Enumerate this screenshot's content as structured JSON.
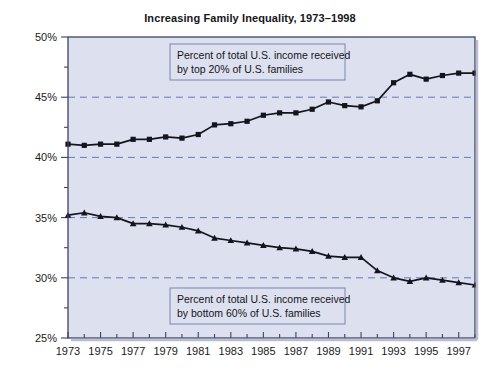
{
  "chart_data": {
    "type": "line",
    "title": "Increasing Family Inequality, 1973–1998",
    "xlabel": "",
    "ylabel": "",
    "xlim": [
      1973,
      1998
    ],
    "ylim": [
      25,
      50
    ],
    "yticks": [
      25,
      30,
      35,
      40,
      45,
      50
    ],
    "ytick_labels": [
      "25%",
      "30%",
      "35%",
      "40%",
      "45%",
      "50%"
    ],
    "y_minor_ticks": [
      27.5,
      32.5,
      37.5,
      42.5,
      47.5
    ],
    "gridlines": [
      30,
      35,
      40,
      45
    ],
    "grid": "horizontal-dashed",
    "legend": "none",
    "x": [
      1973,
      1974,
      1975,
      1976,
      1977,
      1978,
      1979,
      1980,
      1981,
      1982,
      1983,
      1984,
      1985,
      1986,
      1987,
      1988,
      1989,
      1990,
      1991,
      1992,
      1993,
      1994,
      1995,
      1996,
      1997,
      1998
    ],
    "xticks": [
      1973,
      1975,
      1977,
      1979,
      1981,
      1983,
      1985,
      1987,
      1989,
      1991,
      1993,
      1995,
      1997
    ],
    "xtick_labels": [
      "1973",
      "1975",
      "1977",
      "1979",
      "1981",
      "1983",
      "1985",
      "1987",
      "1989",
      "1991",
      "1993",
      "1995",
      "1997"
    ],
    "series": [
      {
        "name": "Percent of total U.S. income received by top 20% of U.S. families",
        "marker": "square",
        "color": "#14141c",
        "values": [
          41.1,
          41.0,
          41.1,
          41.1,
          41.5,
          41.5,
          41.7,
          41.6,
          41.9,
          42.7,
          42.8,
          43.0,
          43.5,
          43.7,
          43.7,
          44.0,
          44.6,
          44.3,
          44.2,
          44.7,
          46.2,
          46.9,
          46.5,
          46.8,
          47.0,
          47.0
        ]
      },
      {
        "name": "Percent of total U.S. income received by bottom 60% of U.S. families",
        "marker": "triangle",
        "color": "#14141c",
        "values": [
          35.2,
          35.4,
          35.1,
          35.0,
          34.5,
          34.5,
          34.4,
          34.2,
          33.9,
          33.3,
          33.1,
          32.9,
          32.7,
          32.5,
          32.4,
          32.2,
          31.8,
          31.7,
          31.7,
          30.6,
          30.0,
          29.7,
          30.0,
          29.8,
          29.6,
          29.4
        ]
      }
    ],
    "annotations": [
      {
        "id": "top-annotation",
        "line1": "Percent of total U.S. income received",
        "line2": "by top 20% of U.S. families",
        "x": 170,
        "y": 44,
        "w": 175,
        "h": 36
      },
      {
        "id": "bottom-annotation",
        "line1": "Percent of total U.S. income received",
        "line2": "by bottom 60% of U.S. families",
        "x": 170,
        "y": 288,
        "w": 175,
        "h": 36
      }
    ],
    "colors": {
      "plot_background": "#dde0ee",
      "figure_background": "#ffffff",
      "grid": "#6878b8",
      "axis": "#3c4460",
      "line": "#14141c",
      "annotation_border": "#7a86b4",
      "annotation_background": "#dde0ee",
      "tick_label": "#1a1a22"
    }
  }
}
